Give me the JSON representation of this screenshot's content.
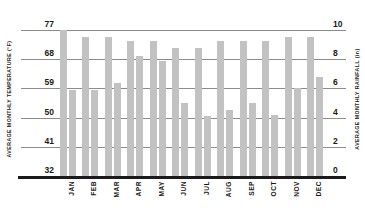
{
  "chart_data": {
    "type": "bar",
    "title": "",
    "subtitle": "",
    "xlabel": "",
    "ylabel": "AVERAGE MONTHLY TEMPERATURE (°F)",
    "y2label": "AVERAGE MONTHLY RAINFALL (in)",
    "grid": true,
    "legend": "none",
    "categories": [
      "JAN",
      "FEB",
      "MAR",
      "APR",
      "MAY",
      "JUN",
      "JUL",
      "AUG",
      "SEP",
      "OCT",
      "NOV",
      "DEC"
    ],
    "ylim": [
      32,
      77
    ],
    "y2lim": [
      0,
      10
    ],
    "yticks": [
      32,
      41,
      50,
      59,
      68,
      77
    ],
    "y2ticks": [
      0,
      2,
      4,
      6,
      8,
      10
    ],
    "ytick_labels": [
      "32",
      "41",
      "50",
      "59",
      "68",
      "77"
    ],
    "y2tick_labels": [
      "0",
      "2",
      "4",
      "6",
      "8",
      "10"
    ],
    "bar_color": "#c2c2c2",
    "axis_color": "#1a1a1a",
    "gridline_color": "#8c8c8c",
    "series": [
      {
        "name": "Average Monthly Temperature",
        "axis": "left",
        "unit": "°F",
        "values": [
          77.0,
          75.0,
          75.0,
          73.5,
          73.5,
          71.5,
          71.5,
          73.5,
          73.5,
          73.5,
          75.0,
          75.0
        ]
      },
      {
        "name": "Average Monthly Rainfall",
        "axis": "right",
        "unit": "in",
        "values": [
          5.9,
          5.9,
          6.4,
          8.2,
          7.9,
          5.0,
          4.1,
          4.5,
          5.0,
          4.2,
          6.0,
          6.8
        ]
      }
    ]
  },
  "axes": {
    "left_title": "AVERAGE MONTHLY TEMPERATURE (°F)",
    "right_title": "AVERAGE MONTHLY RAINFALL (in)"
  }
}
